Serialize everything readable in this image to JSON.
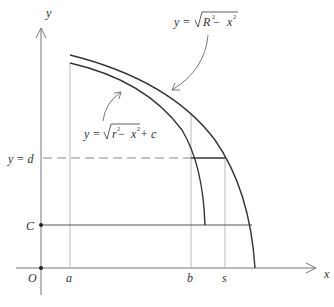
{
  "diagram": {
    "axes": {
      "x_label": "x",
      "y_label": "y",
      "origin_label": "O"
    },
    "x_ticks": [
      {
        "label": "a"
      },
      {
        "label": "b"
      },
      {
        "label": "s"
      }
    ],
    "y_ticks": [
      {
        "label": "y = d"
      },
      {
        "label": "C"
      }
    ],
    "curves": {
      "outer": {
        "eq_prefix": "y = ",
        "radicand_var": "R",
        "radicand_exp": "2",
        "radicand_minus": " − ",
        "radicand_x": "x",
        "radicand_x_exp": "2",
        "suffix": ""
      },
      "inner": {
        "eq_prefix": "y = ",
        "radicand_var": "r",
        "radicand_exp": "2",
        "radicand_minus": " − ",
        "radicand_x": "x",
        "radicand_x_exp": "2",
        "suffix": " + c"
      }
    },
    "colors": {
      "curve": "#333333",
      "axis": "#777777",
      "guide": "#999999",
      "text": "#333333"
    }
  }
}
